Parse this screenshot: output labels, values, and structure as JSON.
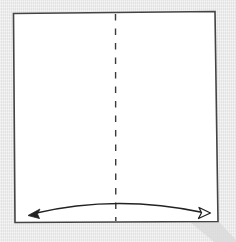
{
  "diagram": {
    "type": "origami-step",
    "colors": {
      "background": "#ebebeb",
      "paper": "#ffffff",
      "outline": "#444444",
      "fold_line": "#3a3a3a",
      "arrow": "#222222",
      "shadow": "#d4d4d4"
    },
    "paper": {
      "shape": "square",
      "corners": [
        [
          13,
          13
        ],
        [
          215,
          11
        ],
        [
          218,
          221
        ],
        [
          15,
          222
        ]
      ]
    },
    "fold_line": {
      "style": "dashed",
      "kind": "valley-fold",
      "x": 115,
      "y_start": 13,
      "y_end": 221
    },
    "arrow": {
      "kind": "fold-and-unfold",
      "from": [
        29,
        215
      ],
      "to": [
        210,
        213
      ],
      "peak": [
        116,
        204
      ],
      "left_head": "filled",
      "right_head": "hollow"
    }
  }
}
